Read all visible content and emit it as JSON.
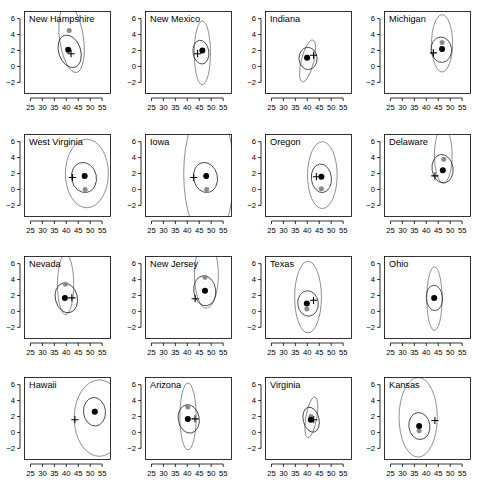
{
  "figure": {
    "type": "small-multiples-scatter-matrix",
    "rows": 4,
    "cols": 4,
    "panel_count": 16,
    "shared_axes": true,
    "x_ticks": [
      25,
      30,
      35,
      40,
      45,
      50,
      55
    ],
    "y_ticks": [
      6,
      4,
      2,
      0,
      -2
    ],
    "x_range": [
      22.5,
      58.5
    ],
    "y_range": [
      -3.4,
      6.9
    ],
    "grid": false,
    "legend": null,
    "xlabel": "",
    "ylabel": "",
    "title": ""
  },
  "chart_data": {
    "type": "scatter",
    "title": "",
    "xlabel": "",
    "ylabel": "",
    "xlim": [
      22.5,
      58.5
    ],
    "ylim": [
      -3.4,
      6.9
    ],
    "xticks": [
      25,
      30,
      35,
      40,
      45,
      50,
      55
    ],
    "yticks": [
      6,
      4,
      2,
      0,
      -2
    ],
    "grid": false,
    "legend_position": "none",
    "marker_types": [
      "black-filled-circle",
      "grey-filled-circle",
      "black-plus"
    ],
    "overlay_types": [
      "outer-ellipse-grey",
      "inner-ellipse-dark"
    ],
    "panels": [
      {
        "label": "New Hampshire",
        "row": 0,
        "col": 0,
        "points_black": [
          [
            40.8,
            2.1
          ]
        ],
        "points_grey": [
          [
            41.2,
            4.5
          ]
        ],
        "cross": [
          42.0,
          1.6
        ],
        "outer_ellipse": {
          "cx": 42.2,
          "cy": 3.5,
          "rx": 5.0,
          "ry": 4.3,
          "angle": -8
        },
        "inner_ellipse": {
          "cx": 41.4,
          "cy": 1.9,
          "rx": 4.6,
          "ry": 2.1,
          "angle": -18
        }
      },
      {
        "label": "New Mexico",
        "row": 0,
        "col": 1,
        "points_black": [
          [
            46.3,
            2.0
          ]
        ],
        "points_grey": [],
        "cross": [
          44.3,
          1.6
        ],
        "outer_ellipse": {
          "cx": 46.3,
          "cy": 1.7,
          "rx": 3.4,
          "ry": 4.0,
          "angle": 0
        },
        "inner_ellipse": {
          "cx": 45.7,
          "cy": 1.8,
          "rx": 3.3,
          "ry": 1.5,
          "angle": -8
        }
      },
      {
        "label": "Indiana",
        "row": 0,
        "col": 2,
        "points_black": [
          [
            39.9,
            1.1
          ]
        ],
        "points_grey": [],
        "cross": [
          42.6,
          1.4
        ],
        "outer_ellipse": {
          "cx": 40.1,
          "cy": 0.7,
          "rx": 2.6,
          "ry": 2.7,
          "angle": 14
        },
        "inner_ellipse": {
          "cx": 40.3,
          "cy": 1.0,
          "rx": 3.8,
          "ry": 1.4,
          "angle": -4
        }
      },
      {
        "label": "Michigan",
        "row": 0,
        "col": 3,
        "points_black": [
          [
            46.6,
            2.2
          ]
        ],
        "points_grey": [
          [
            46.6,
            3.0
          ]
        ],
        "cross": [
          43.0,
          1.7
        ],
        "outer_ellipse": {
          "cx": 46.6,
          "cy": 2.9,
          "rx": 4.4,
          "ry": 3.6,
          "angle": 0
        },
        "inner_ellipse": {
          "cx": 46.3,
          "cy": 2.1,
          "rx": 4.3,
          "ry": 1.6,
          "angle": -6
        }
      },
      {
        "label": "West Virginia",
        "row": 1,
        "col": 0,
        "points_black": [
          [
            47.7,
            1.7
          ]
        ],
        "points_grey": [
          [
            47.9,
            0.0
          ]
        ],
        "cross": [
          42.6,
          1.5
        ],
        "outer_ellipse": {
          "cx": 48.6,
          "cy": 2.0,
          "rx": 9.0,
          "ry": 4.3,
          "angle": 0
        },
        "inner_ellipse": {
          "cx": 47.4,
          "cy": 1.5,
          "rx": 5.2,
          "ry": 1.9,
          "angle": -12
        }
      },
      {
        "label": "Iowa",
        "row": 1,
        "col": 1,
        "points_black": [
          [
            47.9,
            1.7
          ]
        ],
        "points_grey": [
          [
            48.1,
            0.0
          ]
        ],
        "cross": [
          42.7,
          1.5
        ],
        "outer_ellipse": {
          "cx": 49.0,
          "cy": 2.0,
          "rx": 10.5,
          "ry": 8.5,
          "angle": 0
        },
        "inner_ellipse": {
          "cx": 47.6,
          "cy": 1.5,
          "rx": 5.0,
          "ry": 1.9,
          "angle": -12
        }
      },
      {
        "label": "Oregon",
        "row": 1,
        "col": 2,
        "points_black": [
          [
            45.9,
            1.6
          ]
        ],
        "points_grey": [
          [
            45.9,
            0.1
          ]
        ],
        "cross": [
          43.8,
          1.6
        ],
        "outer_ellipse": {
          "cx": 46.3,
          "cy": 1.8,
          "rx": 6.2,
          "ry": 4.2,
          "angle": 0
        },
        "inner_ellipse": {
          "cx": 45.9,
          "cy": 1.4,
          "rx": 4.2,
          "ry": 1.8,
          "angle": -6
        }
      },
      {
        "label": "Delaware",
        "row": 1,
        "col": 3,
        "points_black": [
          [
            46.9,
            2.4
          ]
        ],
        "points_grey": [
          [
            47.3,
            3.8
          ]
        ],
        "cross": [
          43.6,
          1.7
        ],
        "outer_ellipse": {
          "cx": 47.1,
          "cy": 4.3,
          "rx": 3.7,
          "ry": 3.5,
          "angle": 0
        },
        "inner_ellipse": {
          "cx": 46.8,
          "cy": 2.6,
          "rx": 4.4,
          "ry": 1.8,
          "angle": -8
        }
      },
      {
        "label": "Nevada",
        "row": 2,
        "col": 0,
        "points_black": [
          [
            39.4,
            1.7
          ]
        ],
        "points_grey": [
          [
            39.6,
            3.4
          ]
        ],
        "cross": [
          42.3,
          1.7
        ],
        "outer_ellipse": {
          "cx": 39.7,
          "cy": 3.4,
          "rx": 3.4,
          "ry": 3.8,
          "angle": 0
        },
        "inner_ellipse": {
          "cx": 40.0,
          "cy": 1.7,
          "rx": 4.6,
          "ry": 1.9,
          "angle": -14
        }
      },
      {
        "label": "New Jersey",
        "row": 2,
        "col": 1,
        "points_black": [
          [
            47.4,
            2.6
          ]
        ],
        "points_grey": [
          [
            47.4,
            4.3
          ]
        ],
        "cross": [
          43.3,
          1.6
        ],
        "outer_ellipse": {
          "cx": 48.0,
          "cy": 4.6,
          "rx": 5.0,
          "ry": 4.2,
          "angle": 0
        },
        "inner_ellipse": {
          "cx": 47.3,
          "cy": 2.6,
          "rx": 4.6,
          "ry": 1.9,
          "angle": -8
        }
      },
      {
        "label": "Texas",
        "row": 2,
        "col": 2,
        "points_black": [
          [
            39.8,
            1.0
          ]
        ],
        "points_grey": [
          [
            39.8,
            0.3
          ]
        ],
        "cross": [
          42.6,
          1.4
        ],
        "outer_ellipse": {
          "cx": 40.3,
          "cy": 1.8,
          "rx": 5.6,
          "ry": 4.5,
          "angle": 0
        },
        "inner_ellipse": {
          "cx": 40.3,
          "cy": 1.0,
          "rx": 4.3,
          "ry": 1.6,
          "angle": -6
        }
      },
      {
        "label": "Ohio",
        "row": 2,
        "col": 3,
        "points_black": [
          [
            43.3,
            1.7
          ]
        ],
        "points_grey": [],
        "cross": null,
        "outer_ellipse": {
          "cx": 43.4,
          "cy": 1.6,
          "rx": 3.2,
          "ry": 4.0,
          "angle": 0
        },
        "inner_ellipse": {
          "cx": 43.4,
          "cy": 1.7,
          "rx": 3.4,
          "ry": 1.6,
          "angle": -4
        }
      },
      {
        "label": "Hawaii",
        "row": 3,
        "col": 0,
        "points_black": [
          [
            51.9,
            2.6
          ]
        ],
        "points_grey": [
          [
            52.1,
            2.7
          ]
        ],
        "cross": [
          43.6,
          1.6
        ],
        "outer_ellipse": {
          "cx": 53.8,
          "cy": 1.8,
          "rx": 10.5,
          "ry": 4.8,
          "angle": 0
        },
        "inner_ellipse": {
          "cx": 51.8,
          "cy": 2.6,
          "rx": 4.6,
          "ry": 1.8,
          "angle": -6
        }
      },
      {
        "label": "Arizona",
        "row": 3,
        "col": 1,
        "points_black": [
          [
            40.2,
            1.7
          ]
        ],
        "points_grey": [
          [
            40.2,
            3.2
          ]
        ],
        "cross": [
          43.2,
          1.7
        ],
        "outer_ellipse": {
          "cx": 40.3,
          "cy": 2.0,
          "rx": 3.4,
          "ry": 4.2,
          "angle": 0
        },
        "inner_ellipse": {
          "cx": 40.6,
          "cy": 1.7,
          "rx": 4.4,
          "ry": 1.8,
          "angle": -10
        }
      },
      {
        "label": "Virginia",
        "row": 3,
        "col": 2,
        "points_black": [
          [
            41.5,
            1.6
          ]
        ],
        "points_grey": [
          [
            41.5,
            2.0
          ]
        ],
        "cross": [
          42.7,
          1.6
        ],
        "outer_ellipse": {
          "cx": 41.7,
          "cy": 1.9,
          "rx": 2.3,
          "ry": 2.6,
          "angle": 10
        },
        "inner_ellipse": {
          "cx": 41.6,
          "cy": 1.6,
          "rx": 3.3,
          "ry": 1.6,
          "angle": -14
        }
      },
      {
        "label": "Kansas",
        "row": 3,
        "col": 3,
        "points_black": [
          [
            37.0,
            0.8
          ]
        ],
        "points_grey": [
          [
            37.0,
            0.2
          ]
        ],
        "cross": [
          43.6,
          1.5
        ],
        "outer_ellipse": {
          "cx": 36.6,
          "cy": 1.9,
          "rx": 8.0,
          "ry": 5.0,
          "angle": 0
        },
        "inner_ellipse": {
          "cx": 37.1,
          "cy": 0.8,
          "rx": 4.4,
          "ry": 1.7,
          "angle": -8
        }
      }
    ]
  }
}
